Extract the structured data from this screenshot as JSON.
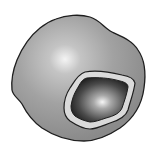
{
  "figure": {
    "parts": [
      {
        "id": "cytoplasm",
        "label": ""
      },
      {
        "id": "nuclear-envelope",
        "label": ""
      },
      {
        "id": "nucleus",
        "label": ""
      }
    ]
  },
  "colors": {
    "background": "#ffffff",
    "outline": "#1e1e1e",
    "cytoplasm_base": "#9a9a9a",
    "cytoplasm_highlight": "#f2f2f2",
    "envelope": "#d8d8d8",
    "nucleus_dark": "#2a2a2a",
    "nucleus_highlight": "#f5f5f5"
  }
}
